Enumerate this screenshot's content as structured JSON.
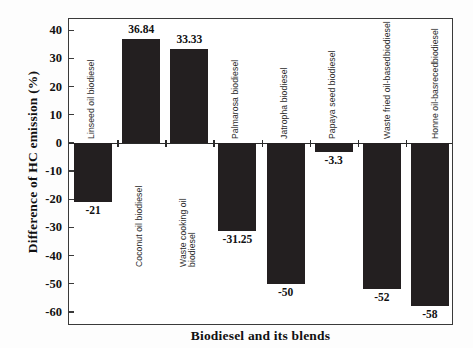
{
  "chart_data": {
    "type": "bar",
    "title": "",
    "xlabel": "Biodiesel and its blends",
    "ylabel": "Difference of HC emission (%)",
    "ylim": [
      -65,
      44
    ],
    "yticks": [
      40,
      30,
      20,
      10,
      0,
      -10,
      -20,
      -30,
      -40,
      -50,
      -60
    ],
    "ytick_labels": [
      "40",
      "30",
      "20",
      "10",
      "0",
      "-10",
      "-20",
      "-30",
      "-40",
      "-50",
      "-60"
    ],
    "grid": false,
    "legend": null,
    "bar_color": "#231f20",
    "categories": [
      "Linseed oil biodiesel",
      "Coconut oil biodiesel",
      "Waste cooking oil biodiesel",
      "Palmarosa biodiesel",
      "Jatropha biodiesel",
      "Papaya seed biodiesel",
      "Waste fried oil-based biodiesel",
      "Honne oil-basreced biodiesel"
    ],
    "values": [
      -21,
      36.84,
      33.33,
      -31.25,
      -50,
      -3.3,
      -52,
      -58
    ],
    "value_labels": [
      "-21",
      "36.84",
      "33.33",
      "-31.25",
      "-50",
      "-3.3",
      "-52",
      "-58"
    ]
  },
  "axes": {
    "y_title": "Difference of HC emission (%)",
    "x_title": "Biodiesel and its blends"
  }
}
